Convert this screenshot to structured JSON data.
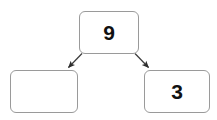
{
  "diagram": {
    "type": "tree",
    "background_color": "#ffffff",
    "node_border_color": "#9a9a9a",
    "node_fill_color": "#ffffff",
    "edge_color": "#3a3a3a",
    "text_color": "#111111",
    "nodes": [
      {
        "id": "root",
        "label": "9",
        "role": "parent"
      },
      {
        "id": "left",
        "label": "",
        "role": "left-child"
      },
      {
        "id": "right",
        "label": "3",
        "role": "right-child"
      }
    ],
    "edges": [
      {
        "from": "root",
        "to": "left",
        "arrow": "to-left-child"
      },
      {
        "from": "root",
        "to": "right",
        "arrow": "to-right-child"
      }
    ]
  }
}
